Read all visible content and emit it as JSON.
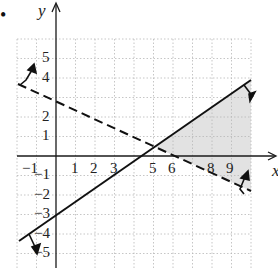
{
  "chart_data": {
    "type": "line",
    "title": "",
    "xlabel": "x",
    "ylabel": "y",
    "xlim": [
      -2,
      10
    ],
    "ylim": [
      -5.7,
      6
    ],
    "grid": true,
    "x_ticks": [
      "-1",
      "1",
      "2",
      "3",
      "5",
      "6",
      "8",
      "9"
    ],
    "y_ticks": [
      "5",
      "4",
      "2",
      "1",
      "-1",
      "-2",
      "-3",
      "-4",
      "-5"
    ],
    "series": [
      {
        "name": "boundary-solid",
        "style": "solid",
        "equation_approx": "y = 0.7x - 3",
        "points": [
          [
            -2,
            -4.4
          ],
          [
            0,
            -3
          ],
          [
            10,
            3.9
          ]
        ],
        "shade_direction": "below"
      },
      {
        "name": "boundary-dashed",
        "style": "dashed",
        "equation_approx": "y = -0.47x + 3",
        "points": [
          [
            -2,
            3.9
          ],
          [
            0,
            3
          ],
          [
            10,
            -1.8
          ]
        ],
        "shade_direction": "above"
      }
    ],
    "shaded_region": {
      "description": "region below solid line and above dashed line, to the right of intersection",
      "vertices": [
        [
          5.1,
          0.5
        ],
        [
          10,
          3.9
        ],
        [
          10,
          -1.8
        ]
      ],
      "color": "#e2e2e2"
    },
    "intersection": [
      5.1,
      0.5
    ]
  },
  "labels": {
    "bullet": "•",
    "y_axis": "y",
    "x_axis": "x",
    "x_ticks": [
      {
        "text": "−1",
        "x": 22,
        "y": 173
      },
      {
        "text": "1",
        "x": 71,
        "y": 173
      },
      {
        "text": "2",
        "x": 90,
        "y": 173
      },
      {
        "text": "3",
        "x": 110,
        "y": 173
      },
      {
        "text": "5",
        "x": 149,
        "y": 173
      },
      {
        "text": "6",
        "x": 168,
        "y": 173
      },
      {
        "text": "8",
        "x": 207,
        "y": 173
      },
      {
        "text": "9",
        "x": 226,
        "y": 173
      }
    ],
    "y_ticks": [
      {
        "text": "5",
        "x": 42,
        "y": 62
      },
      {
        "text": "4",
        "x": 42,
        "y": 82
      },
      {
        "text": "2",
        "x": 42,
        "y": 121
      },
      {
        "text": "1",
        "x": 42,
        "y": 140
      },
      {
        "text": "−1",
        "x": 34,
        "y": 179
      },
      {
        "text": "−2",
        "x": 34,
        "y": 199
      },
      {
        "text": "−3",
        "x": 34,
        "y": 218
      },
      {
        "text": "−4",
        "x": 34,
        "y": 238
      },
      {
        "text": "−5",
        "x": 34,
        "y": 257
      }
    ]
  },
  "colors": {
    "ink": "#1a1a1a",
    "grid": "#b8b8b8",
    "shade": "#e2e2e2"
  }
}
